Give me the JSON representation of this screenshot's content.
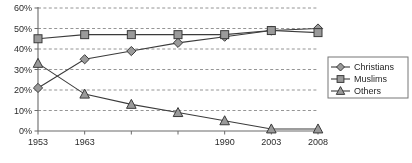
{
  "chart_data": {
    "type": "line",
    "title": "",
    "subtitle": "",
    "xlabel": "",
    "ylabel": "",
    "grid": true,
    "legend_position": "right",
    "ylim": [
      0,
      60
    ],
    "ytick_labels": [
      "0%",
      "10%",
      "20%",
      "30%",
      "40%",
      "50%",
      "60%"
    ],
    "ytick_values": [
      0,
      10,
      20,
      30,
      40,
      50,
      60
    ],
    "categories": [
      "1953",
      "1963",
      "",
      "",
      "1990",
      "2003",
      "2008"
    ],
    "xtick_labels": [
      "1953",
      "1963",
      "",
      "",
      "1990",
      "2003",
      "2008"
    ],
    "series": [
      {
        "name": "Christians",
        "marker": "diamond",
        "values": [
          21,
          35,
          39,
          43,
          46,
          49,
          50
        ]
      },
      {
        "name": "Muslims",
        "marker": "square",
        "values": [
          45,
          47,
          47,
          47,
          47,
          49,
          48
        ]
      },
      {
        "name": "Others",
        "marker": "triangle",
        "values": [
          33,
          18,
          13,
          9,
          5,
          1,
          1
        ]
      }
    ]
  },
  "legend": {
    "items": [
      {
        "label": "Christians",
        "marker": "diamond"
      },
      {
        "label": "Muslims",
        "marker": "square"
      },
      {
        "label": "Others",
        "marker": "triangle"
      }
    ]
  },
  "colors": {
    "marker_fill": "#9a9a9a",
    "marker_stroke": "#3a3a3a",
    "line": "#3b3b3b",
    "grid": "#7a7a7a",
    "axis": "#6b6b6b",
    "text": "#2b2b2b",
    "background": "#ffffff"
  }
}
